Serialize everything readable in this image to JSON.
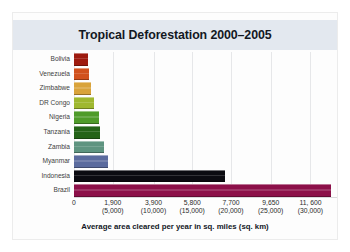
{
  "chart_data": {
    "type": "bar",
    "orientation": "horizontal",
    "title": "Tropical Deforestation 2000–2005",
    "xlabel": "Average area cleared per year in sq. miles (sq. km)",
    "ylabel": "",
    "xlim": [
      0,
      12900
    ],
    "grid": true,
    "legend": "none",
    "units_primary": "sq. miles",
    "units_secondary": "sq. km",
    "categories": [
      "Bolivia",
      "Venezuela",
      "Zimbabwe",
      "DR Congo",
      "Nigeria",
      "Tanzania",
      "Zambia",
      "Myanmar",
      "Indonesia",
      "Brazil"
    ],
    "values": [
      700,
      760,
      830,
      980,
      1220,
      1280,
      1450,
      1680,
      7400,
      12600
    ],
    "bar_colors": [
      "#9e1b0f",
      "#d1511d",
      "#d9a33a",
      "#9fb82f",
      "#4f9b2a",
      "#246318",
      "#5e9480",
      "#5b6b9e",
      "#0b0b11",
      "#8c1049"
    ],
    "tick_labels_primary": [
      "0",
      "1,900",
      "3,900",
      "5,800",
      "7,700",
      "9,650",
      "11, 600"
    ],
    "tick_labels_secondary": [
      "",
      "(5,000)",
      "(10,000)",
      "(15,000)",
      "(20,000)",
      "(25,000)",
      "(30,000)"
    ],
    "tick_values": [
      0,
      1900,
      3900,
      5800,
      7700,
      9650,
      11600
    ]
  },
  "figure": {
    "title_band_color": "#e3e8ef",
    "background_color": "#fdfdfd"
  }
}
